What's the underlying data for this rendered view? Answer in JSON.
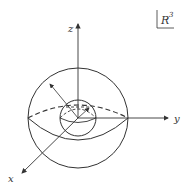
{
  "diagram": {
    "space_label": "R",
    "space_exponent": "3",
    "axes": {
      "x": "x",
      "y": "y",
      "z": "z"
    },
    "stroke_color": "#333333",
    "shapes": {
      "outer_sphere": {
        "cx": 78,
        "cy": 118,
        "r": 50
      },
      "inner_sphere": {
        "cx": 78,
        "cy": 118,
        "r": 18
      }
    }
  }
}
